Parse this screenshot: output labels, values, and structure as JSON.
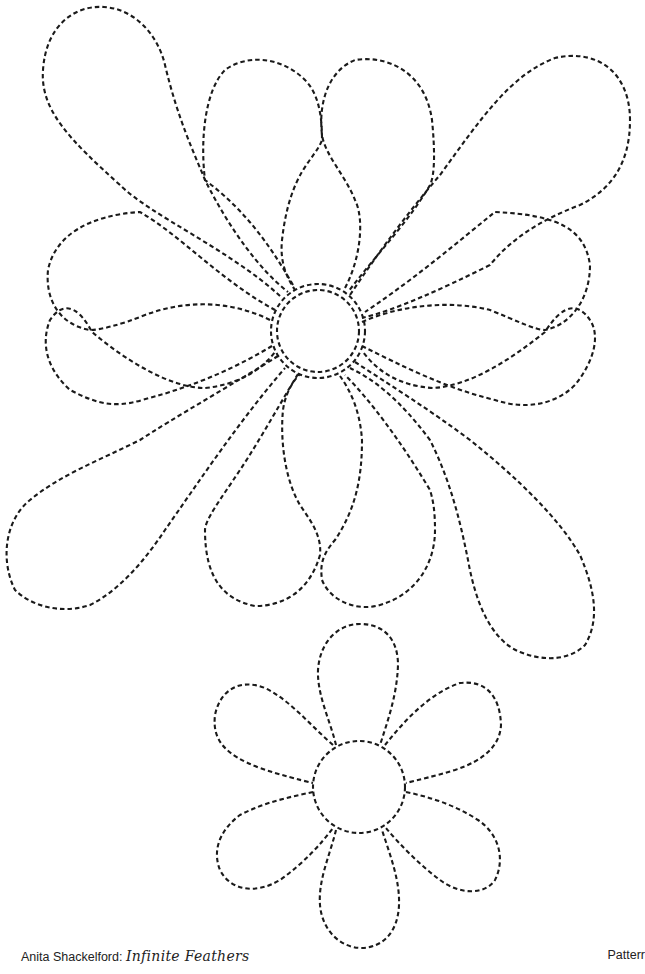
{
  "page": {
    "background": "#ffffff",
    "line_color": "#1a1a1a",
    "line_style": "dashed"
  },
  "pattern": {
    "large_flower": {
      "name": "large feathered flower",
      "center": {
        "x": 317,
        "y": 330
      },
      "center_rings": 2,
      "petal_count": 12
    },
    "small_flower": {
      "name": "small flower",
      "center": {
        "x": 359,
        "y": 787
      },
      "petal_count": 6
    }
  },
  "footer": {
    "author": "Anita Shackelford: ",
    "book_title": "Infinite Feathers",
    "label": "Patterr"
  }
}
